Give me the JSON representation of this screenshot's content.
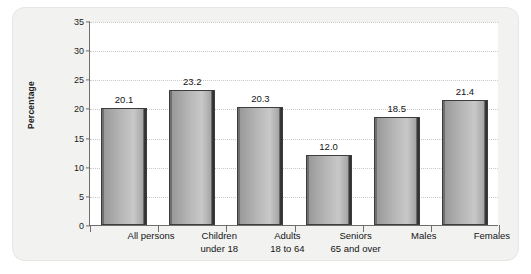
{
  "chart_data": {
    "type": "bar",
    "title": "",
    "subtitle": "",
    "xlabel": "",
    "ylabel": "Percentage",
    "ylim": [
      0,
      35
    ],
    "ytick_step": 5,
    "yticks": [
      "0",
      "5",
      "10",
      "15",
      "20",
      "25",
      "30",
      "35"
    ],
    "grid": true,
    "grid_style": "dotted-horizontal",
    "legend": "none",
    "categories": [
      "All persons",
      "Children under 18",
      "Adults 18 to 64",
      "Seniors 65 and over",
      "Males",
      "Females"
    ],
    "category_lines": [
      [
        "All persons",
        ""
      ],
      [
        "Children",
        "under 18"
      ],
      [
        "Adults",
        "18 to 64"
      ],
      [
        "Seniors",
        "65 and over"
      ],
      [
        "Males",
        ""
      ],
      [
        "Females",
        ""
      ]
    ],
    "values": [
      20.1,
      23.2,
      20.3,
      12.0,
      18.5,
      21.4
    ],
    "value_labels": [
      "20.1",
      "23.2",
      "20.3",
      "12.0",
      "18.5",
      "21.4"
    ]
  },
  "style": {
    "panel_background": "#f2f2f1",
    "plot_background": "#ffffff",
    "axis_color": "#6e6e6e",
    "gridline_color": "#c9c9c9",
    "bar_fill_light": "#c8c8c8",
    "bar_fill_mid": "#b4b4b4",
    "bar_edge_dark": "#2d2d2d",
    "text_color": "#141414"
  }
}
